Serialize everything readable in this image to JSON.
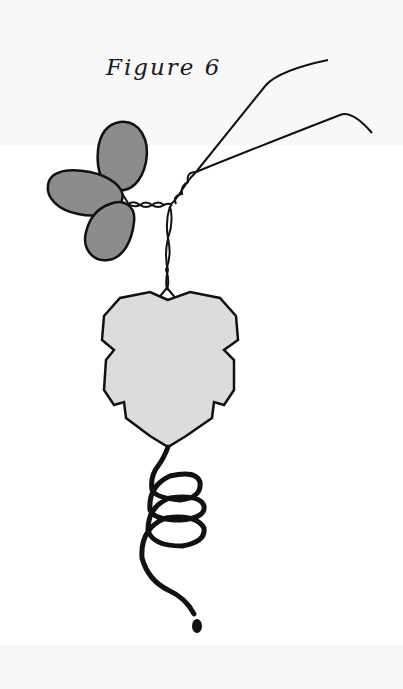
{
  "figure": {
    "caption": "Figure 6",
    "elements": [
      "wire-ends",
      "twisted-wire",
      "three-petal-leaves",
      "large-leaf-charm",
      "coiled-wire-spiral"
    ],
    "colors": {
      "background": "#f8f8f8",
      "outline": "#111111",
      "petal_fill": "#8c8c8c",
      "leaf_fill": "#dcdcdc"
    }
  }
}
